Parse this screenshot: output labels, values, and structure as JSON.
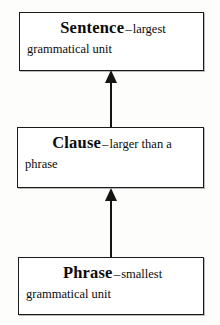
{
  "diagram": {
    "type": "flowchart-vertical",
    "background_color": "#fdfdfc",
    "line_color": "#141414",
    "nodes": [
      {
        "id": "sentence",
        "term": "Sentence",
        "dash": "–",
        "desc": "largest",
        "desc_continued": "grammatical unit",
        "full_text": "Sentence – largest grammatical unit"
      },
      {
        "id": "clause",
        "term": "Clause",
        "dash": "–",
        "desc": "larger than a",
        "desc_continued": "phrase",
        "full_text": "Clause – larger than a phrase"
      },
      {
        "id": "phrase",
        "term": "Phrase",
        "dash": "–",
        "desc": "smallest",
        "desc_continued": "grammatical unit",
        "full_text": "Phrase – smallest grammatical unit"
      }
    ],
    "arrows": [
      {
        "id": "phrase-to-clause",
        "from": "phrase",
        "to": "clause",
        "direction": "up"
      },
      {
        "id": "clause-to-sentence",
        "from": "clause",
        "to": "sentence",
        "direction": "up"
      }
    ]
  }
}
